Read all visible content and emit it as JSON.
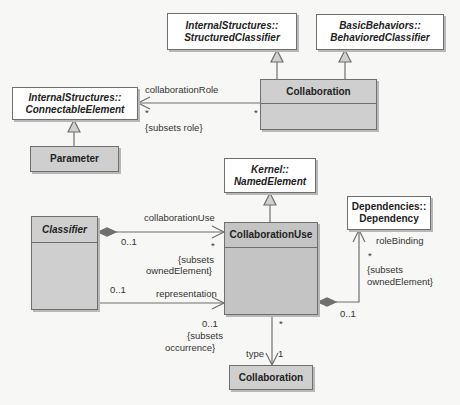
{
  "diagram": {
    "type": "UML class diagram",
    "classes": {
      "structured_classifier": {
        "line1": "InternalStructures::",
        "line2": "StructuredClassifier"
      },
      "behaviored_classifier": {
        "line1": "BasicBehaviors::",
        "line2": "BehavioredClassifier"
      },
      "connectable_element": {
        "line1": "InternalStructures::",
        "line2": "ConnectableElement"
      },
      "collaboration_top": {
        "name": "Collaboration"
      },
      "parameter": {
        "name": "Parameter"
      },
      "named_element": {
        "line1": "Kernel::",
        "line2": "NamedElement"
      },
      "classifier": {
        "name": "Classifier"
      },
      "collaboration_use": {
        "name": "CollaborationUse"
      },
      "dependency": {
        "line1": "Dependencies::",
        "line2": "Dependency"
      },
      "collaboration_bottom": {
        "name": "Collaboration"
      }
    },
    "associations": {
      "collaboration_role": {
        "role": "collaborationRole",
        "mult_target": "*",
        "mult_source": "*",
        "constraint": "{subsets role}"
      },
      "collaboration_use": {
        "role": "collaborationUse",
        "mult_source": "0..1",
        "mult_target": "*",
        "constraint_line1": "{subsets",
        "constraint_line2": "ownedElement}"
      },
      "representation": {
        "role": "representation",
        "mult_source": "0..1",
        "mult_target": "0..1",
        "constraint_line1": "{subsets",
        "constraint_line2": "occurrence}"
      },
      "role_binding": {
        "role": "roleBinding",
        "mult_target": "*",
        "mult_source": "0..1",
        "constraint_line1": "{subsets",
        "constraint_line2": "ownedElement}"
      },
      "type": {
        "role": "type",
        "mult_target": "1",
        "mult_source": "*"
      }
    },
    "colors": {
      "abstract_fill": "#ffffff",
      "concrete_fill": "#cfcfcf",
      "line": "#6f6f6f",
      "background": "#f7f7f5"
    }
  }
}
